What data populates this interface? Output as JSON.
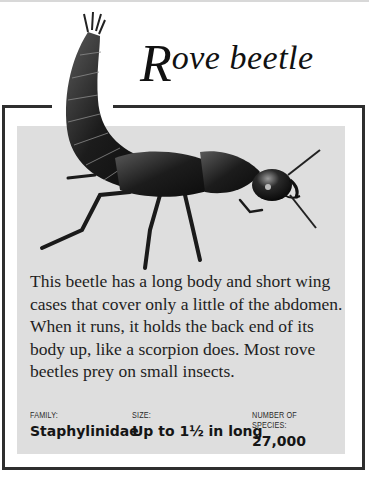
{
  "title": {
    "initial": "R",
    "rest": "ove beetle"
  },
  "description": "This beetle has a long body and short wing cases that cover only a little of the abdomen. When it runs, it holds the back end of its body up, like a scorpion does. Most rove beetles prey on small insects.",
  "facts": [
    {
      "label": "FAMILY:",
      "value": "Staphylinidae"
    },
    {
      "label": "SIZE:",
      "value": "Up to 1½ in long"
    },
    {
      "label": "NUMBER OF SPECIES:",
      "value": "27,000"
    }
  ],
  "illustration": {
    "subject": "rove-beetle",
    "description": "Black rove beetle with abdomen curled upward like a scorpion"
  },
  "colors": {
    "frame": "#2e2e2e",
    "panel": "#dedede",
    "text": "#1e1e1e"
  }
}
